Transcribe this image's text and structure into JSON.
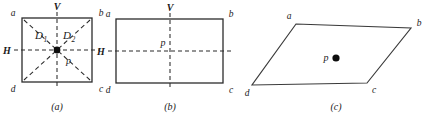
{
  "figure": {
    "background_color": "#ffffff",
    "line_color": "#2b2b2b",
    "text_color": "#1a1a1a",
    "width": 436,
    "height": 117
  },
  "panels": [
    {
      "id": "a",
      "caption": "(a)",
      "shape": "square",
      "vertices": [
        {
          "name": "a",
          "label": "a",
          "x": 22,
          "y": 18
        },
        {
          "name": "b",
          "label": "b",
          "x": 92,
          "y": 18
        },
        {
          "name": "c",
          "label": "c",
          "x": 92,
          "y": 82
        },
        {
          "name": "d",
          "label": "d",
          "x": 22,
          "y": 82
        }
      ],
      "axes": [
        {
          "name": "vertical-axis",
          "label": "V",
          "x1": 57,
          "y1": 12,
          "x2": 57,
          "y2": 88
        },
        {
          "name": "horizontal-axis",
          "label": "H",
          "x1": 14,
          "y1": 50,
          "x2": 100,
          "y2": 50
        }
      ],
      "diagonals": [
        {
          "name": "D1",
          "label": "D",
          "subscript": "1",
          "x1": 24,
          "y1": 20,
          "x2": 90,
          "y2": 80
        },
        {
          "name": "D2",
          "label": "D",
          "subscript": "2",
          "x1": 90,
          "y1": 20,
          "x2": 24,
          "y2": 80
        }
      ],
      "center_point": {
        "name": "p",
        "label": "p",
        "x": 57,
        "y": 50,
        "radius": 3.4
      }
    },
    {
      "id": "b",
      "caption": "(b)",
      "shape": "rectangle",
      "vertices": [
        {
          "name": "a",
          "label": "a",
          "x": 116,
          "y": 19
        },
        {
          "name": "b",
          "label": "b",
          "x": 223,
          "y": 19
        },
        {
          "name": "c",
          "label": "c",
          "x": 223,
          "y": 83
        },
        {
          "name": "d",
          "label": "d",
          "x": 116,
          "y": 83
        }
      ],
      "axes": [
        {
          "name": "vertical-axis",
          "label": "V",
          "x1": 170,
          "y1": 13,
          "x2": 170,
          "y2": 89
        },
        {
          "name": "horizontal-axis",
          "label": "H",
          "x1": 108,
          "y1": 51,
          "x2": 231,
          "y2": 51
        }
      ],
      "diagonals": [],
      "center_point": {
        "name": "p",
        "label": "p",
        "x": 170,
        "y": 51,
        "radius": 0
      }
    },
    {
      "id": "c",
      "caption": "(c)",
      "shape": "parallelogram",
      "vertices": [
        {
          "name": "a",
          "label": "a",
          "x": 296,
          "y": 24
        },
        {
          "name": "b",
          "label": "b",
          "x": 411,
          "y": 28
        },
        {
          "name": "c",
          "label": "c",
          "x": 367,
          "y": 83
        },
        {
          "name": "d",
          "label": "d",
          "x": 252,
          "y": 85
        }
      ],
      "axes": [],
      "diagonals": [],
      "center_point": {
        "name": "p",
        "label": "p",
        "x": 336,
        "y": 58,
        "radius": 3.6
      }
    }
  ],
  "labels": {
    "vertex_a": "a",
    "vertex_b": "b",
    "vertex_c": "c",
    "vertex_d": "d",
    "axis_v": "V",
    "axis_h": "H",
    "diagonal_1": "D",
    "diagonal_1_sub": "1",
    "diagonal_2": "D",
    "diagonal_2_sub": "2",
    "point_p": "p",
    "caption_a": "(a)",
    "caption_b": "(b)",
    "caption_c": "(c)"
  }
}
